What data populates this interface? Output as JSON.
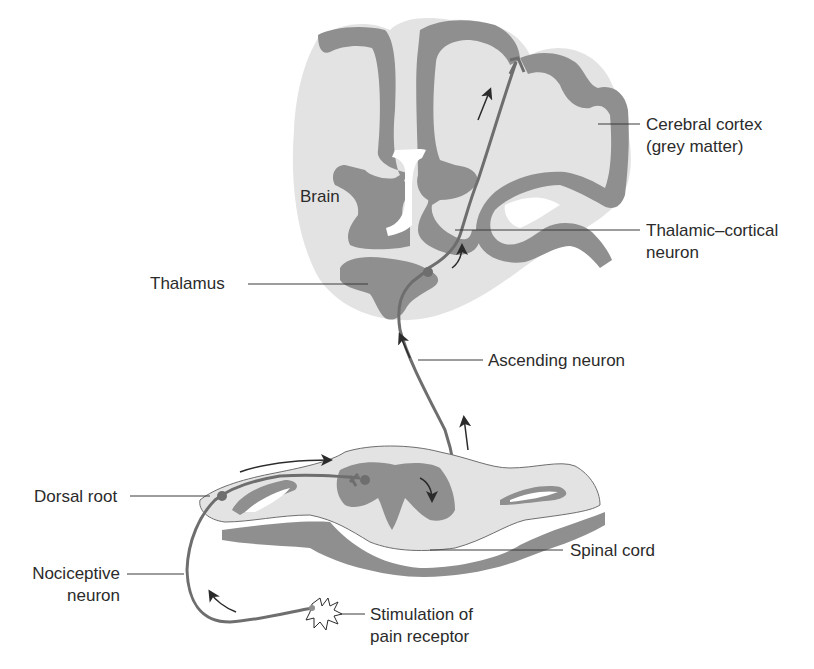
{
  "diagram": {
    "type": "pain pathway anatomical diagram",
    "colors": {
      "background": "#ffffff",
      "white_matter": "#e3e3e3",
      "grey_matter": "#8f8f8f",
      "neuron": "#6e6e6e",
      "text": "#2b2b2b",
      "leader_line": "#3a3a3a"
    },
    "brain_label": "Brain",
    "labels": {
      "cerebral_cortex_line1": "Cerebral cortex",
      "cerebral_cortex_line2": "(grey matter)",
      "thalamic_cortical_line1": "Thalamic–cortical",
      "thalamic_cortical_line2": "neuron",
      "thalamus": "Thalamus",
      "ascending_neuron": "Ascending neuron",
      "dorsal_root": "Dorsal root",
      "spinal_cord": "Spinal cord",
      "nociceptive_line1": "Nociceptive",
      "nociceptive_line2": "neuron",
      "stimulation_line1": "Stimulation of",
      "stimulation_line2": "pain receptor"
    },
    "flow_direction": [
      "pain receptor",
      "nociceptive neuron",
      "dorsal root",
      "spinal cord",
      "ascending neuron",
      "thalamus",
      "thalamic-cortical neuron",
      "cerebral cortex"
    ]
  }
}
